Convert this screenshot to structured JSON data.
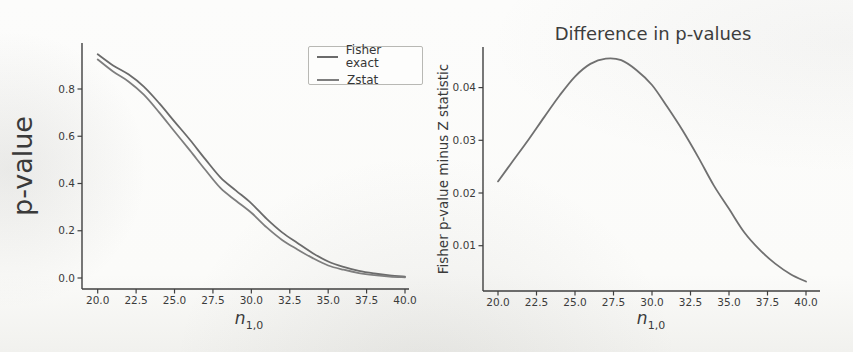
{
  "figure": {
    "background": "#fbfbf9",
    "axis_color": "#3f3f3f",
    "tick_label_color": "#3b3b3b"
  },
  "chart_data": [
    {
      "type": "line",
      "title": "",
      "xlabel": "n_{1,0}",
      "xlabel_base": "n",
      "xlabel_sub": "1,0",
      "ylabel": "p-value",
      "xlim": [
        19.0,
        40.3
      ],
      "ylim": [
        -0.05,
        1.0
      ],
      "grid": false,
      "legend_position": "upper right",
      "xticks": [
        20,
        22.5,
        25,
        27.5,
        30,
        32.5,
        35,
        37.5,
        40
      ],
      "xtick_labels": [
        "20.0",
        "22.5",
        "25.0",
        "27.5",
        "30.0",
        "32.5",
        "35.0",
        "37.5",
        "40.0"
      ],
      "yticks": [
        0.0,
        0.2,
        0.4,
        0.6,
        0.8
      ],
      "ytick_labels": [
        "0.0",
        "0.2",
        "0.4",
        "0.6",
        "0.8"
      ],
      "x": [
        20,
        21,
        22,
        23,
        24,
        25,
        26,
        27,
        28,
        29,
        30,
        31,
        32,
        33,
        34,
        35,
        36,
        37,
        38,
        39,
        40
      ],
      "series": [
        {
          "name": "Fisher exact",
          "color": "#6b6b6b",
          "values": [
            0.947,
            0.9,
            0.862,
            0.81,
            0.74,
            0.662,
            0.585,
            0.503,
            0.425,
            0.37,
            0.316,
            0.25,
            0.193,
            0.148,
            0.105,
            0.07,
            0.047,
            0.03,
            0.019,
            0.011,
            0.006
          ]
        },
        {
          "name": "Zstat",
          "color": "#7e7e7e",
          "values": [
            0.925,
            0.874,
            0.832,
            0.776,
            0.701,
            0.62,
            0.54,
            0.458,
            0.38,
            0.327,
            0.276,
            0.214,
            0.161,
            0.121,
            0.084,
            0.053,
            0.035,
            0.021,
            0.012,
            0.006,
            0.003
          ]
        }
      ]
    },
    {
      "type": "line",
      "title": "Difference in p-values",
      "xlabel": "n_{1,0}",
      "xlabel_base": "n",
      "xlabel_sub": "1,0",
      "ylabel": "Fisher p-value minus Z statistic",
      "xlim": [
        19.0,
        40.9
      ],
      "ylim": [
        0.001,
        0.048
      ],
      "grid": false,
      "legend_position": "none",
      "xticks": [
        20,
        22.5,
        25,
        27.5,
        30,
        32.5,
        35,
        37.5,
        40
      ],
      "xtick_labels": [
        "20.0",
        "22.5",
        "25.0",
        "27.5",
        "30.0",
        "32.5",
        "35.0",
        "37.5",
        "40.0"
      ],
      "yticks": [
        0.01,
        0.02,
        0.03,
        0.04
      ],
      "ytick_labels": [
        "0.01",
        "0.02",
        "0.03",
        "0.04"
      ],
      "x": [
        20,
        21,
        22,
        23,
        24,
        25,
        26,
        27,
        28,
        29,
        30,
        31,
        32,
        33,
        34,
        35,
        36,
        37,
        38,
        39,
        40
      ],
      "series": [
        {
          "name": "Fisher p-value minus Z statistic",
          "color": "#707070",
          "values": [
            0.0222,
            0.0262,
            0.0302,
            0.0344,
            0.0385,
            0.0421,
            0.0445,
            0.0455,
            0.0452,
            0.0433,
            0.0405,
            0.0363,
            0.0318,
            0.0268,
            0.0215,
            0.017,
            0.0125,
            0.0092,
            0.0066,
            0.0046,
            0.0032
          ]
        }
      ]
    }
  ]
}
